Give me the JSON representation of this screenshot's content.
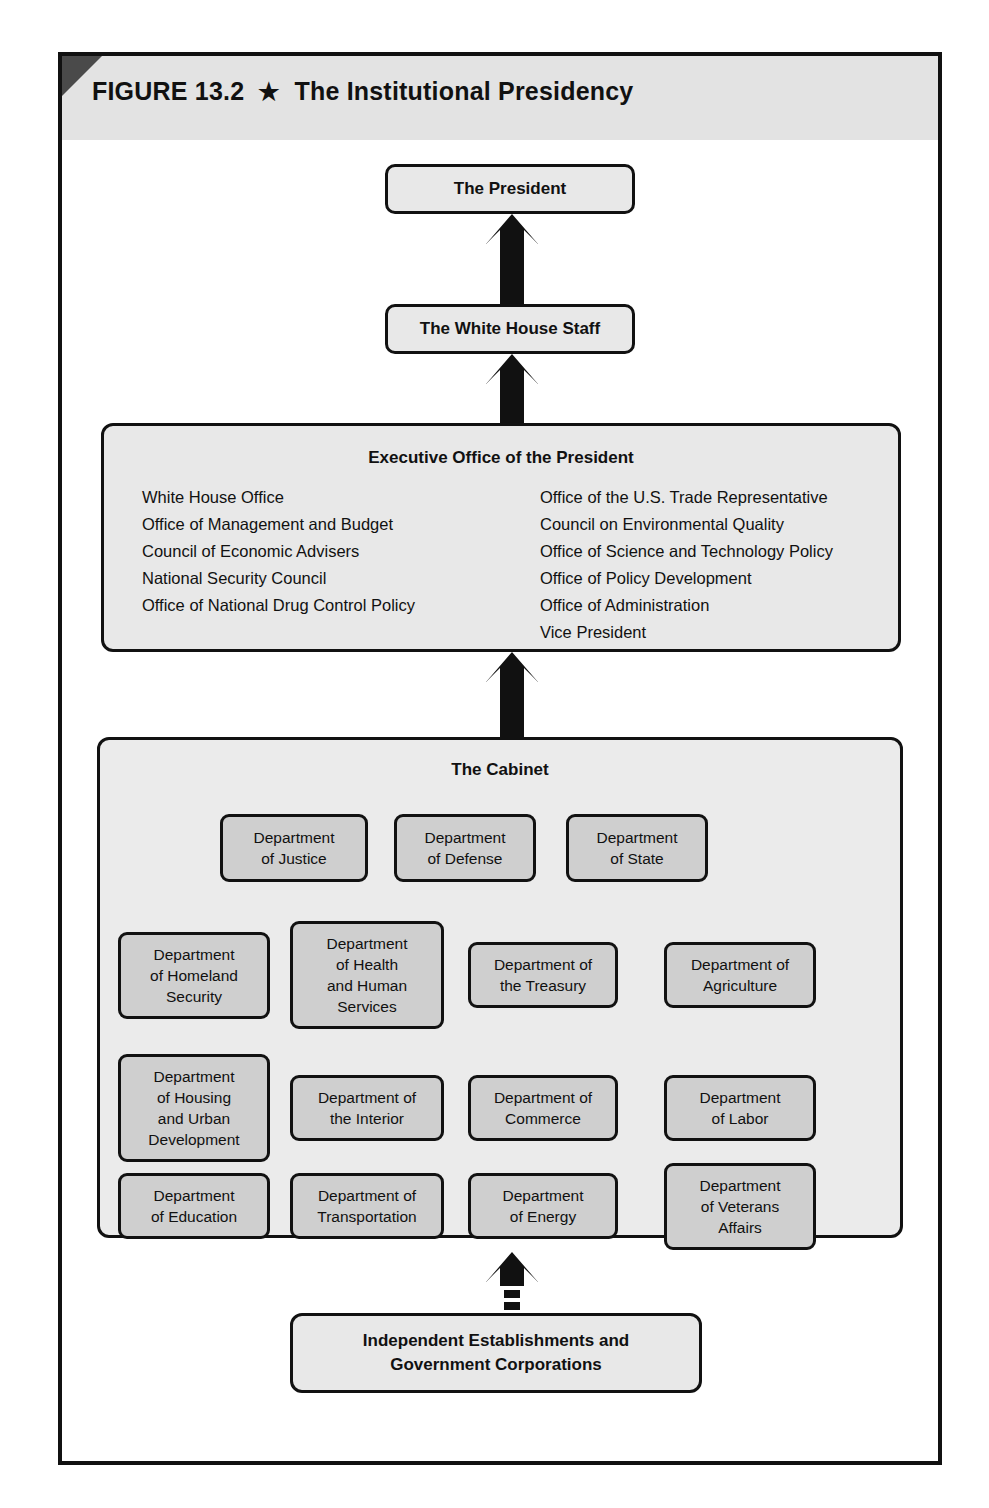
{
  "figure": {
    "number_label": "FIGURE 13.2",
    "star_glyph": "★",
    "title": "The Institutional Presidency"
  },
  "colors": {
    "frame_border": "#111111",
    "banner_background": "#e3e3e3",
    "banner_corner": "#4a4a4a",
    "node_fill": "#e8e8e8",
    "cabinet_panel_fill": "#ebebeb",
    "department_fill": "#cfcfcf",
    "arrow_fill": "#111111"
  },
  "nodes": {
    "president": "The President",
    "white_house_staff": "The White House Staff",
    "independent": {
      "line1": "Independent Establishments and",
      "line2": "Government Corporations"
    }
  },
  "eop": {
    "title": "Executive Office of the President",
    "left_column": [
      "White House Office",
      "Office of Management and Budget",
      "Council of Economic Advisers",
      "National Security Council",
      "Office of National Drug Control Policy"
    ],
    "right_column": [
      "Office of the U.S. Trade Representative",
      "Council on Environmental Quality",
      "Office of Science and Technology Policy",
      "Office of Policy Development",
      "Office of Administration",
      "Vice President"
    ]
  },
  "cabinet": {
    "title": "The Cabinet",
    "rows": [
      [
        {
          "lines": [
            "Department",
            "of Justice"
          ]
        },
        {
          "lines": [
            "Department",
            "of Defense"
          ]
        },
        {
          "lines": [
            "Department",
            "of State"
          ]
        }
      ],
      [
        {
          "lines": [
            "Department",
            "of Homeland",
            "Security"
          ]
        },
        {
          "lines": [
            "Department",
            "of Health",
            "and Human",
            "Services"
          ]
        },
        {
          "lines": [
            "Department of",
            "the Treasury"
          ]
        },
        {
          "lines": [
            "Department of",
            "Agriculture"
          ]
        }
      ],
      [
        {
          "lines": [
            "Department",
            "of Housing",
            "and Urban",
            "Development"
          ]
        },
        {
          "lines": [
            "Department of",
            "the Interior"
          ]
        },
        {
          "lines": [
            "Department of",
            "Commerce"
          ]
        },
        {
          "lines": [
            "Department",
            "of Labor"
          ]
        }
      ],
      [
        {
          "lines": [
            "Department",
            "of Education"
          ]
        },
        {
          "lines": [
            "Department of",
            "Transportation"
          ]
        },
        {
          "lines": [
            "Department",
            "of Energy"
          ]
        },
        {
          "lines": [
            "Department",
            "of Veterans",
            "Affairs"
          ]
        }
      ]
    ]
  },
  "arrows": [
    {
      "name": "white-house-staff-to-president",
      "style": "solid"
    },
    {
      "name": "eop-to-white-house-staff",
      "style": "solid"
    },
    {
      "name": "cabinet-to-eop",
      "style": "solid"
    },
    {
      "name": "independent-to-cabinet",
      "style": "dashed"
    }
  ]
}
